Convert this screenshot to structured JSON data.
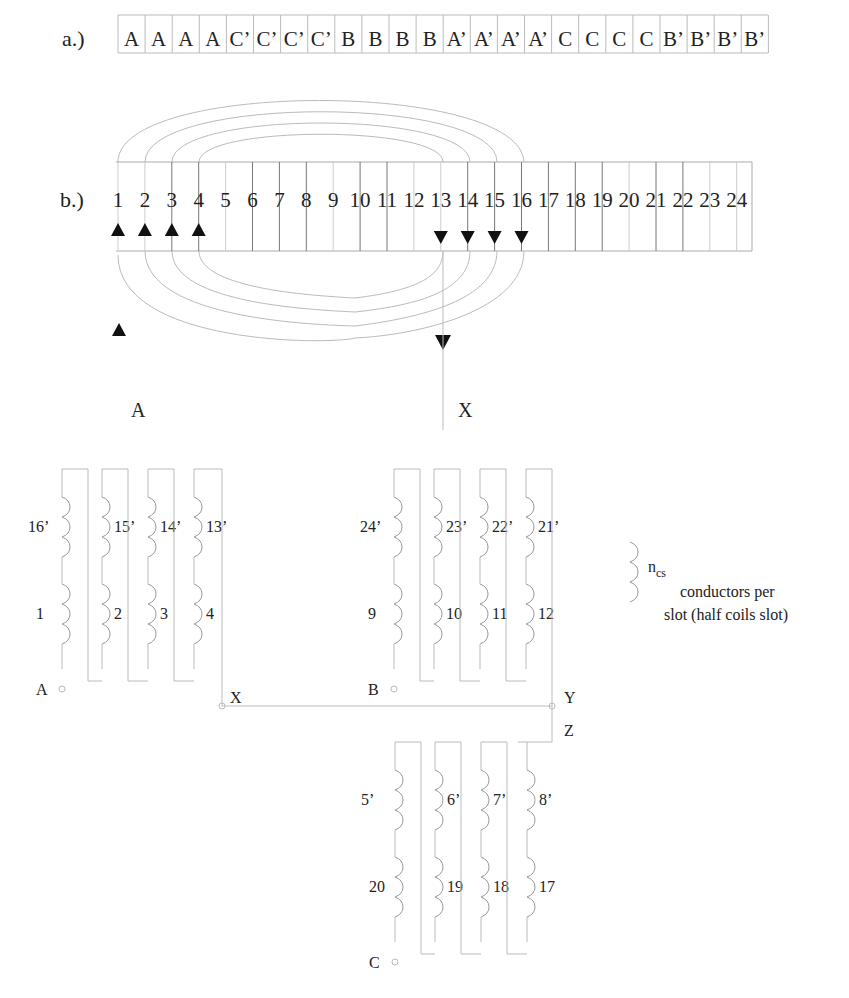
{
  "part_a": {
    "label": "a.)",
    "slots": [
      "A",
      "A",
      "A",
      "A",
      "C’",
      "C’",
      "C’",
      "C’",
      "B",
      "B",
      "B",
      "B",
      "A’",
      "A’",
      "A’",
      "A’",
      "C",
      "C",
      "C",
      "C",
      "B’",
      "B’",
      "B’",
      "B’"
    ]
  },
  "part_b": {
    "label": "b.)",
    "slot_numbers": [
      "1",
      "2",
      "3",
      "4",
      "5",
      "6",
      "7",
      "8",
      "9",
      "10",
      "11",
      "12",
      "13",
      "14",
      "15",
      "16",
      "17",
      "18",
      "19",
      "20",
      "21",
      "22",
      "23",
      "24"
    ],
    "terminal_start": "A",
    "terminal_end": "X"
  },
  "phase_a": {
    "top_coils": [
      "16’",
      "15’",
      "14’",
      "13’"
    ],
    "bottom_coils": [
      "1",
      "2",
      "3",
      "4"
    ],
    "start_terminal": "A",
    "end_terminal": "X"
  },
  "phase_b": {
    "top_coils": [
      "24’",
      "23’",
      "22’",
      "21’"
    ],
    "bottom_coils": [
      "9",
      "10",
      "11",
      "12"
    ],
    "start_terminal": "B",
    "end_terminal": "Y"
  },
  "phase_c": {
    "top_coils": [
      "5’",
      "6’",
      "7’",
      "8’"
    ],
    "bottom_coils": [
      "20",
      "19",
      "18",
      "17"
    ],
    "start_terminal": "C",
    "end_terminal": "Z"
  },
  "legend": {
    "symbol_label": "n",
    "symbol_subscript": "cs",
    "line1": "conductors per",
    "line2": "slot (half coils slot)"
  }
}
